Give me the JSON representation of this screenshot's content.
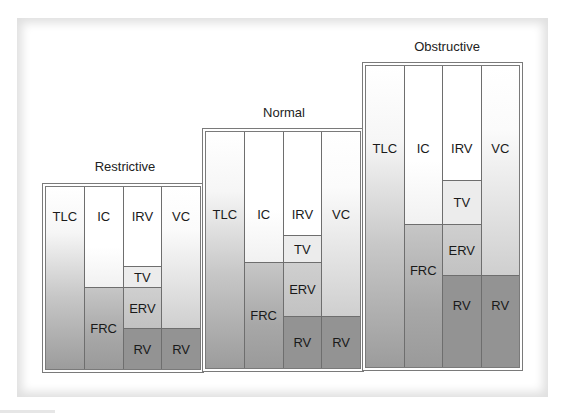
{
  "diagram": {
    "colors": {
      "border": "#6e6e6e",
      "white": "#ffffff",
      "tv": "#ececec",
      "erv": "#c8c8c8",
      "frc": "#aaaaaa",
      "rv": "#939393"
    },
    "blocks": [
      {
        "title": "Restrictive",
        "columns": [
          {
            "cells": [
              {
                "label": "TLC"
              }
            ]
          },
          {
            "cells": [
              {
                "label": "IC"
              },
              {
                "label": "FRC"
              }
            ]
          },
          {
            "cells": [
              {
                "label": "IRV"
              },
              {
                "label": "TV"
              },
              {
                "label": "ERV"
              },
              {
                "label": "RV"
              }
            ]
          },
          {
            "cells": [
              {
                "label": "VC"
              },
              {
                "label": "RV"
              }
            ]
          }
        ]
      },
      {
        "title": "Normal",
        "columns": [
          {
            "cells": [
              {
                "label": "TLC"
              }
            ]
          },
          {
            "cells": [
              {
                "label": "IC"
              },
              {
                "label": "FRC"
              }
            ]
          },
          {
            "cells": [
              {
                "label": "IRV"
              },
              {
                "label": "TV"
              },
              {
                "label": "ERV"
              },
              {
                "label": "RV"
              }
            ]
          },
          {
            "cells": [
              {
                "label": "VC"
              },
              {
                "label": "RV"
              }
            ]
          }
        ]
      },
      {
        "title": "Obstructive",
        "columns": [
          {
            "cells": [
              {
                "label": "TLC"
              }
            ]
          },
          {
            "cells": [
              {
                "label": "IC"
              },
              {
                "label": "FRC"
              }
            ]
          },
          {
            "cells": [
              {
                "label": "IRV"
              },
              {
                "label": "TV"
              },
              {
                "label": "ERV"
              },
              {
                "label": "RV"
              }
            ]
          },
          {
            "cells": [
              {
                "label": "VC"
              },
              {
                "label": "RV"
              }
            ]
          }
        ]
      }
    ]
  }
}
